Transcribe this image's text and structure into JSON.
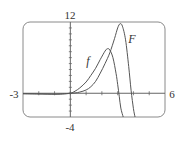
{
  "chart_data": {
    "type": "line",
    "title": "",
    "xlabel": "",
    "ylabel": "",
    "xlim": [
      -3,
      6
    ],
    "ylim": [
      -4,
      12
    ],
    "grid": false,
    "frame": "rounded-rectangle",
    "axis_labels": {
      "x_min": "-3",
      "x_max": "6",
      "y_min": "-4",
      "y_max": "12"
    },
    "xticks": [
      -3,
      -2,
      -1,
      0,
      1,
      2,
      3,
      4,
      5,
      6
    ],
    "yticks": [
      -4,
      -3,
      -2,
      -1,
      0,
      1,
      2,
      3,
      4,
      5,
      6,
      7,
      8,
      9,
      10,
      11,
      12
    ],
    "series": [
      {
        "name": "f",
        "label": "f",
        "label_pos": [
          1.1,
          5.3
        ],
        "x": [
          -3,
          -2,
          -1,
          -0.5,
          0,
          0.3,
          0.6,
          1.0,
          1.3,
          1.6,
          1.9,
          2.2,
          2.35,
          2.5,
          2.7,
          2.9,
          3.0,
          3.1,
          3.2,
          3.35
        ],
        "y": [
          -0.1,
          -0.12,
          -0.15,
          -0.12,
          0,
          0.35,
          0.9,
          1.9,
          3.0,
          4.2,
          5.7,
          7.1,
          7.5,
          7.3,
          6.0,
          3.3,
          1.5,
          -0.5,
          -2.5,
          -4
        ]
      },
      {
        "name": "F",
        "label": "F",
        "label_pos": [
          3.85,
          9.0
        ],
        "x": [
          -3,
          -2,
          -1,
          -0.5,
          0,
          0.3,
          0.6,
          1.0,
          1.3,
          1.6,
          1.9,
          2.2,
          2.5,
          2.8,
          3.0,
          3.15,
          3.3,
          3.5,
          3.7,
          3.85,
          4.0,
          4.1
        ],
        "y": [
          -0.05,
          -0.1,
          -0.15,
          -0.1,
          0,
          0.05,
          0.2,
          0.55,
          1.1,
          2.0,
          3.4,
          5.0,
          6.8,
          9.2,
          11.0,
          11.7,
          11.3,
          9.0,
          4.5,
          0.5,
          -2.6,
          -4
        ]
      }
    ]
  },
  "colors": {
    "curve": "#555555",
    "axis": "#666666",
    "frame": "#8a8a8a",
    "text": "#333333"
  }
}
